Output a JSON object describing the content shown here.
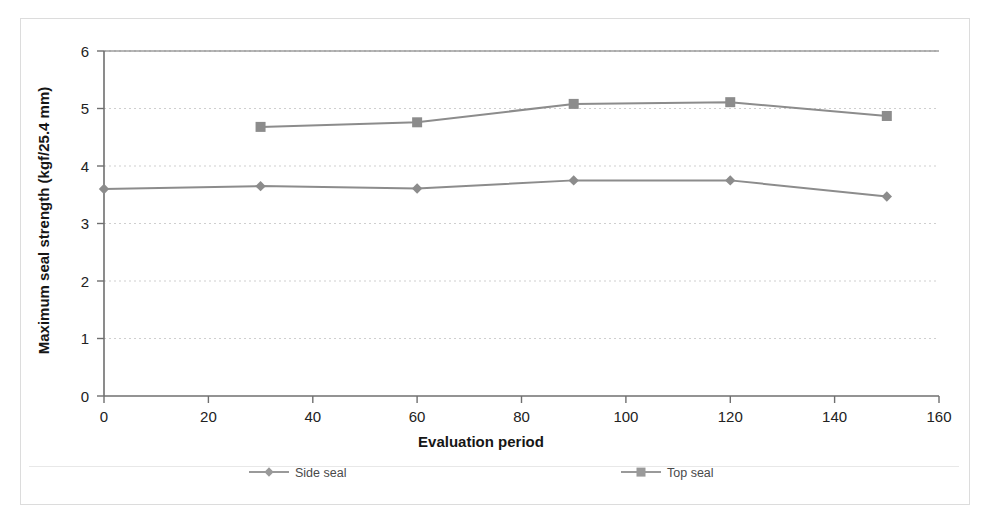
{
  "figure": {
    "border_color": "#dcdcdc",
    "background": "#ffffff"
  },
  "chart_data": {
    "type": "line",
    "title": "",
    "xlabel": "Evaluation period",
    "ylabel": "Maximum seal strength (kgf/25.4 mm)",
    "xlim": [
      0,
      160
    ],
    "ylim": [
      0,
      6
    ],
    "xticks": [
      0,
      20,
      40,
      60,
      80,
      100,
      120,
      140,
      160
    ],
    "xtick_labels": [
      "0",
      "20",
      "40",
      "60",
      "80",
      "100",
      "120",
      "140",
      "160"
    ],
    "yticks": [
      0,
      1,
      2,
      3,
      4,
      5,
      6
    ],
    "ytick_labels": [
      "0",
      "1",
      "2",
      "3",
      "4",
      "5",
      "6"
    ],
    "grid": "horizontal-dotted",
    "legend_position": "bottom",
    "series": [
      {
        "name": "Side seal",
        "marker": "diamond",
        "color": "#8c8c8c",
        "x": [
          0,
          30,
          60,
          90,
          120,
          150
        ],
        "values": [
          3.6,
          3.65,
          3.61,
          3.75,
          3.75,
          3.47
        ]
      },
      {
        "name": "Top seal",
        "marker": "square",
        "color": "#8c8c8c",
        "x": [
          30,
          60,
          90,
          120,
          150
        ],
        "values": [
          4.68,
          4.76,
          5.08,
          5.11,
          4.87
        ]
      }
    ]
  },
  "legend": {
    "items": [
      {
        "label": "Side seal",
        "marker": "diamond"
      },
      {
        "label": "Top seal",
        "marker": "square"
      }
    ]
  }
}
